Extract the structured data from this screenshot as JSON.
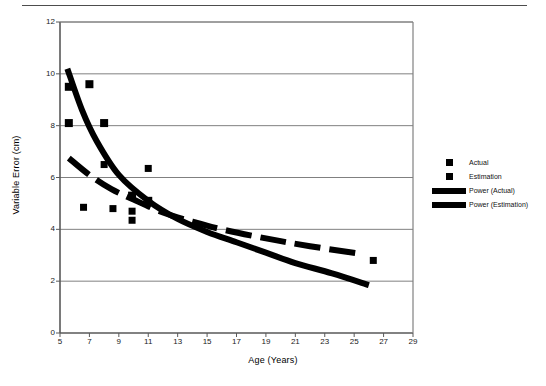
{
  "chart_data": {
    "type": "scatter",
    "title": "",
    "xlabel": "Age (Years)",
    "ylabel": "Variable Error (cm)",
    "xlim": [
      5,
      29
    ],
    "ylim": [
      0,
      12
    ],
    "xticks": [
      5,
      7,
      9,
      11,
      13,
      15,
      17,
      19,
      21,
      23,
      25,
      27,
      29
    ],
    "yticks": [
      0,
      2,
      4,
      6,
      8,
      10,
      12
    ],
    "grid": "horizontal",
    "legend_position": "right",
    "series": [
      {
        "name": "Actual",
        "marker": "square",
        "points": [
          {
            "x": 5.6,
            "y": 9.5
          },
          {
            "x": 7.0,
            "y": 9.6
          },
          {
            "x": 5.6,
            "y": 8.1
          },
          {
            "x": 8.0,
            "y": 8.1
          },
          {
            "x": 9.9,
            "y": 5.3
          },
          {
            "x": 11.0,
            "y": 5.1
          }
        ]
      },
      {
        "name": "Estimation",
        "marker": "square",
        "points": [
          {
            "x": 8.0,
            "y": 6.5
          },
          {
            "x": 11.0,
            "y": 6.35
          },
          {
            "x": 6.6,
            "y": 4.85
          },
          {
            "x": 8.6,
            "y": 4.8
          },
          {
            "x": 9.9,
            "y": 4.7
          },
          {
            "x": 9.9,
            "y": 4.35
          },
          {
            "x": 26.3,
            "y": 2.8
          }
        ]
      },
      {
        "name": "Power (Actual)",
        "style": "solid-thick",
        "points": [
          {
            "x": 5.5,
            "y": 10.2
          },
          {
            "x": 6.5,
            "y": 8.6
          },
          {
            "x": 7.5,
            "y": 7.4
          },
          {
            "x": 9.0,
            "y": 6.1
          },
          {
            "x": 11.0,
            "y": 5.1
          },
          {
            "x": 13.0,
            "y": 4.4
          },
          {
            "x": 15.0,
            "y": 3.9
          },
          {
            "x": 17.0,
            "y": 3.5
          },
          {
            "x": 19.0,
            "y": 3.1
          },
          {
            "x": 21.0,
            "y": 2.7
          },
          {
            "x": 23.5,
            "y": 2.3
          },
          {
            "x": 26.0,
            "y": 1.85
          }
        ]
      },
      {
        "name": "Power (Estimation)",
        "style": "dashed-thick",
        "points": [
          {
            "x": 5.6,
            "y": 6.75
          },
          {
            "x": 7.0,
            "y": 6.1
          },
          {
            "x": 8.5,
            "y": 5.55
          },
          {
            "x": 10.0,
            "y": 5.15
          },
          {
            "x": 12.0,
            "y": 4.65
          },
          {
            "x": 14.0,
            "y": 4.3
          },
          {
            "x": 16.0,
            "y": 4.0
          },
          {
            "x": 19.0,
            "y": 3.65
          },
          {
            "x": 22.0,
            "y": 3.35
          },
          {
            "x": 25.5,
            "y": 3.05
          }
        ]
      }
    ]
  },
  "legend": {
    "entries": [
      {
        "label": "Actual",
        "key": "square-marker"
      },
      {
        "label": "Estimation",
        "key": "square-marker"
      },
      {
        "label": "Power (Actual)",
        "key": "thick-line"
      },
      {
        "label": "Power (Estimation)",
        "key": "thick-line"
      }
    ]
  }
}
